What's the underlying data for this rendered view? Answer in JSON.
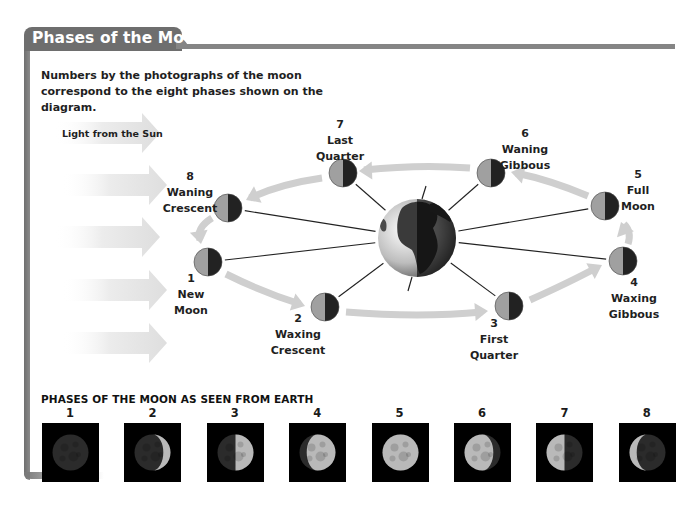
{
  "header": {
    "title": "Phases of the Moon",
    "intro_text": "Numbers by the photographs of the moon correspond to the eight phases shown on the diagram."
  },
  "diagram": {
    "sun_label": "Light from the Sun",
    "center_body": "earth",
    "phases": [
      {
        "number": "1",
        "name_line1": "New",
        "name_line2": "Moon"
      },
      {
        "number": "2",
        "name_line1": "Waxing",
        "name_line2": "Crescent"
      },
      {
        "number": "3",
        "name_line1": "First",
        "name_line2": "Quarter"
      },
      {
        "number": "4",
        "name_line1": "Waxing",
        "name_line2": "Gibbous"
      },
      {
        "number": "5",
        "name_line1": "Full",
        "name_line2": "Moon"
      },
      {
        "number": "6",
        "name_line1": "Waning",
        "name_line2": "Gibbous"
      },
      {
        "number": "7",
        "name_line1": "Last",
        "name_line2": "Quarter"
      },
      {
        "number": "8",
        "name_line1": "Waning",
        "name_line2": "Crescent"
      }
    ],
    "colors": {
      "moon_lit": "#a0a0a0",
      "moon_dark": "#222222",
      "orbit_arrow": "#cfcfcf",
      "sun_arrow": "#e4e4e4"
    }
  },
  "photos": {
    "heading": "PHASES OF THE MOON AS SEEN FROM EARTH",
    "items": [
      {
        "number": "1",
        "illuminated_fraction": 0.0,
        "lit_side": "none"
      },
      {
        "number": "2",
        "illuminated_fraction": 0.2,
        "lit_side": "right"
      },
      {
        "number": "3",
        "illuminated_fraction": 0.5,
        "lit_side": "right"
      },
      {
        "number": "4",
        "illuminated_fraction": 0.8,
        "lit_side": "right"
      },
      {
        "number": "5",
        "illuminated_fraction": 1.0,
        "lit_side": "full"
      },
      {
        "number": "6",
        "illuminated_fraction": 0.8,
        "lit_side": "left"
      },
      {
        "number": "7",
        "illuminated_fraction": 0.5,
        "lit_side": "left"
      },
      {
        "number": "8",
        "illuminated_fraction": 0.2,
        "lit_side": "left"
      }
    ]
  }
}
